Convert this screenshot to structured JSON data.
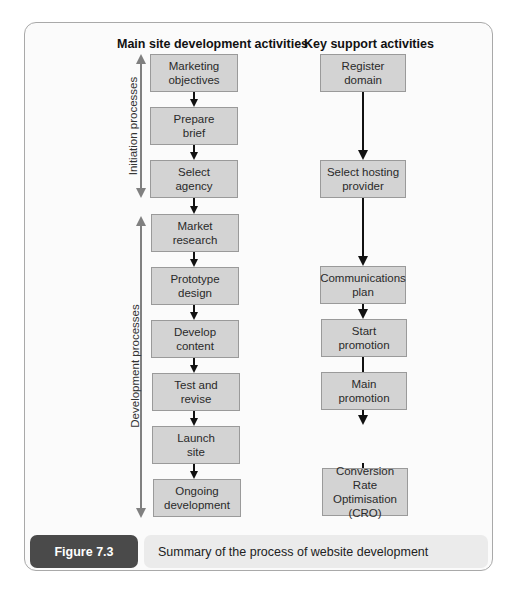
{
  "figure": {
    "label": "Figure 7.3",
    "caption": "Summary of the process of website development"
  },
  "columns": {
    "main": {
      "header": "Main site development activities",
      "steps": [
        {
          "label": "Marketing\nobjectives"
        },
        {
          "label": "Prepare\nbrief"
        },
        {
          "label": "Select\nagency"
        },
        {
          "label": "Market\nresearch"
        },
        {
          "label": "Prototype\ndesign"
        },
        {
          "label": "Develop\ncontent"
        },
        {
          "label": "Test and\nrevise"
        },
        {
          "label": "Launch\nsite"
        },
        {
          "label": "Ongoing\ndevelopment"
        }
      ]
    },
    "support": {
      "header": "Key support activities",
      "steps": [
        {
          "label": "Register\ndomain"
        },
        {
          "label": "Select hosting\nprovider"
        },
        {
          "label": "Communications\nplan"
        },
        {
          "label": "Start\npromotion"
        },
        {
          "label": "Main\npromotion"
        },
        {
          "label": "Conversion Rate\nOptimisation\n(CRO)"
        }
      ]
    }
  },
  "phases": [
    {
      "label": "Initiation processes",
      "spans_steps": [
        "Marketing objectives",
        "Prepare brief",
        "Select agency"
      ]
    },
    {
      "label": "Development processes",
      "spans_steps": [
        "Market research",
        "Prototype design",
        "Develop content",
        "Test and revise",
        "Launch site",
        "Ongoing development"
      ]
    }
  ],
  "colors": {
    "box_fill": "#d3d3d3",
    "box_border": "#9a9a9a",
    "phase_arrow": "#808080",
    "flow_arrow": "#111111",
    "figure_label_bg": "#4a4a4a",
    "caption_bg": "#ebebeb"
  }
}
